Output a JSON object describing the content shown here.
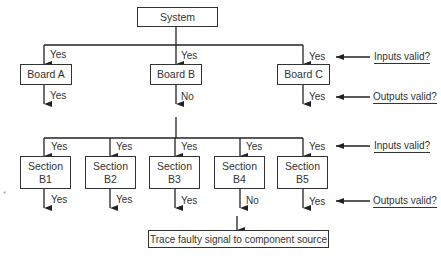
{
  "diagram": {
    "type": "troubleshooting-flowchart",
    "root": {
      "label": "System"
    },
    "boards": [
      {
        "label": "Board A",
        "input_result": "Yes",
        "output_result": "Yes"
      },
      {
        "label": "Board B",
        "input_result": "Yes",
        "output_result": "No"
      },
      {
        "label": "Board C",
        "input_result": "Yes",
        "output_result": "Yes"
      }
    ],
    "sections": [
      {
        "label_line1": "Section",
        "label_line2": "B1",
        "input_result": "Yes",
        "output_result": "Yes"
      },
      {
        "label_line1": "Section",
        "label_line2": "B2",
        "input_result": "Yes",
        "output_result": "Yes"
      },
      {
        "label_line1": "Section",
        "label_line2": "B3",
        "input_result": "Yes",
        "output_result": "Yes"
      },
      {
        "label_line1": "Section",
        "label_line2": "B4",
        "input_result": "Yes",
        "output_result": "No"
      },
      {
        "label_line1": "Section",
        "label_line2": "B5",
        "input_result": "Yes",
        "output_result": "Yes"
      }
    ],
    "questions": {
      "inputs": "Inputs valid?",
      "outputs": "Outputs valid?"
    },
    "final": {
      "label": "Trace faulty signal to component source"
    },
    "stray_mark": "*"
  }
}
